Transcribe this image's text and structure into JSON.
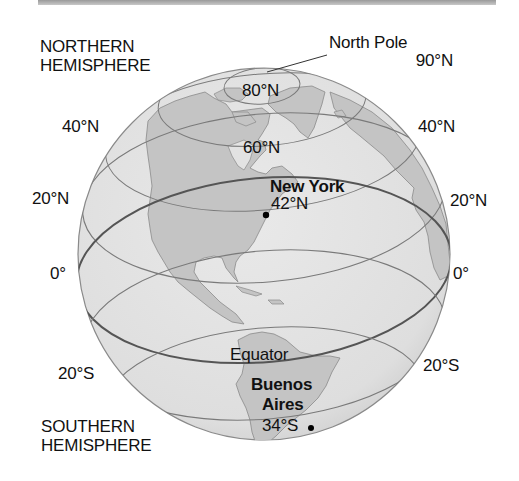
{
  "header": {
    "bar": "top-rule"
  },
  "labels": {
    "northern_line1": "NORTHERN",
    "northern_line2": "HEMISPHERE",
    "southern_line1": "SOUTHERN",
    "southern_line2": "HEMISPHERE",
    "north_pole": "North Pole",
    "north_pole_lat": "90°N",
    "lat_80n": "80°N",
    "lat_60n": "60°N",
    "lat_40n_left": "40°N",
    "lat_40n_right": "40°N",
    "lat_20n_left": "20°N",
    "lat_20n_right": "20°N",
    "lat_0_left": "0°",
    "lat_0_right": "0°",
    "equator": "Equator",
    "lat_20s_left": "20°S",
    "lat_20s_right": "20°S"
  },
  "cities": [
    {
      "name": "New York",
      "lat": "42°N"
    },
    {
      "name_line1": "Buenos",
      "name_line2": "Aires",
      "lat": "34°S"
    }
  ],
  "colors": {
    "ocean": "#e2e2e2",
    "land": "#c4c4c4",
    "gridline": "#7a7a7a",
    "equator": "#555555",
    "outline": "#8a8a8a"
  }
}
